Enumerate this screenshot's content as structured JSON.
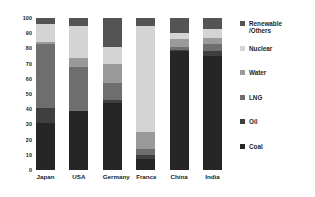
{
  "chart_data": {
    "type": "bar",
    "subtype": "stacked-vertical-100-percent",
    "title": "",
    "xlabel": "",
    "ylabel": "",
    "ylim": [
      0,
      100
    ],
    "yticks": [
      0,
      10,
      20,
      30,
      40,
      50,
      60,
      70,
      80,
      90,
      100
    ],
    "grid": false,
    "legend_position": "right",
    "categories": [
      "Japan",
      "USA",
      "Germany",
      "France",
      "China",
      "India"
    ],
    "series": [
      {
        "name": "Coal",
        "color": "#262626",
        "values": [
          31,
          39,
          44,
          7,
          78,
          75
        ]
      },
      {
        "name": "Oil",
        "color": "#3f3f3f",
        "values": [
          10,
          0,
          2,
          3,
          1,
          3
        ]
      },
      {
        "name": "LNG",
        "color": "#6e6e6e",
        "values": [
          42,
          29,
          11,
          4,
          2,
          5
        ]
      },
      {
        "name": "Water",
        "color": "#9a9a9a",
        "values": [
          1,
          6,
          13,
          11,
          5,
          4
        ]
      },
      {
        "name": "Nuclear",
        "color": "#d4d4d4",
        "values": [
          12,
          21,
          11,
          70,
          4,
          6
        ]
      },
      {
        "name": "Renewable\n/Others",
        "color": "#545454",
        "values": [
          4,
          5,
          19,
          5,
          10,
          7
        ]
      }
    ],
    "legend_entries": [
      {
        "label": "Renewable\n/Others",
        "color": "#545454"
      },
      {
        "label": "Nuclear",
        "color": "#d4d4d4"
      },
      {
        "label": "Water",
        "color": "#9a9a9a"
      },
      {
        "label": "LNG",
        "color": "#6e6e6e"
      },
      {
        "label": "Oil",
        "color": "#3f3f3f"
      },
      {
        "label": "Coal",
        "color": "#262626"
      }
    ]
  }
}
